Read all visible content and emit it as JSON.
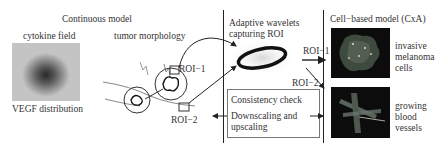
{
  "sections": {
    "continuous_model": {
      "title": "Continuous model",
      "cytokine_field": {
        "label": "cytokine field",
        "caption": "VEGF distribution"
      },
      "tumor_morphology": {
        "label": "tumor morphology",
        "roi_labels": [
          "ROI−1",
          "ROI−2"
        ]
      }
    },
    "wavelets": {
      "title_line1": "Adaptive wavelets",
      "title_line2": "capturing ROI"
    },
    "consistency": {
      "line1": "Consistency check",
      "line2": "Downscaling and",
      "line3": "upscaling"
    },
    "cell_model": {
      "title": "Cell−based model (CxA)",
      "roi_labels": [
        "ROI−1",
        "ROI−2"
      ],
      "items": [
        {
          "line1": "invasive",
          "line2": "melanoma",
          "line3": "cells"
        },
        {
          "line1": "growing",
          "line2": "blood",
          "line3": "vessels"
        }
      ]
    }
  },
  "colors": {
    "ink": "#222222",
    "box_border": "#777777",
    "image_bg": "#0c0c0c"
  }
}
